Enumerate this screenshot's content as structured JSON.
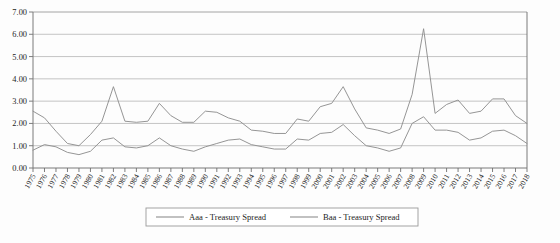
{
  "chart_data": {
    "type": "line",
    "title": "",
    "subtitle": "",
    "xlabel": "",
    "ylabel": "",
    "ylim": [
      0.0,
      7.0
    ],
    "ytick_step": 1.0,
    "ytick_labels": [
      "0.00",
      "1.00",
      "2.00",
      "3.00",
      "4.00",
      "5.00",
      "6.00",
      "7.00"
    ],
    "ytick_values": [
      0,
      1,
      2,
      3,
      4,
      5,
      6,
      7
    ],
    "grid": "horizontal",
    "legend_position": "bottom",
    "categories": [
      "1975",
      "1976",
      "1977",
      "1978",
      "1979",
      "1980",
      "1981",
      "1982",
      "1983",
      "1984",
      "1985",
      "1986",
      "1987",
      "1988",
      "1989",
      "1990",
      "1991",
      "1992",
      "1993",
      "1994",
      "1995",
      "1996",
      "1997",
      "1998",
      "1999",
      "2000",
      "2001",
      "2002",
      "2003",
      "2004",
      "2005",
      "2006",
      "2007",
      "2008",
      "2009",
      "2010",
      "2011",
      "2012",
      "2013",
      "2014",
      "2015",
      "2016",
      "2017",
      "2018"
    ],
    "series": [
      {
        "name": "Aaa - Treasury Spread",
        "color": "#8f8f8f",
        "values": [
          0.8,
          1.05,
          0.95,
          0.7,
          0.6,
          0.75,
          1.25,
          1.35,
          0.95,
          0.9,
          1.0,
          1.35,
          1.0,
          0.85,
          0.75,
          0.95,
          1.1,
          1.25,
          1.3,
          1.05,
          0.95,
          0.85,
          0.85,
          1.3,
          1.25,
          1.55,
          1.6,
          1.95,
          1.45,
          1.0,
          0.9,
          0.75,
          0.9,
          2.0,
          2.3,
          1.7,
          1.7,
          1.6,
          1.25,
          1.35,
          1.65,
          1.7,
          1.45,
          1.1
        ]
      },
      {
        "name": "Baa - Treasury Spread",
        "color": "#8f8f8f",
        "values": [
          2.55,
          2.25,
          1.65,
          1.1,
          1.0,
          1.5,
          2.1,
          3.65,
          2.1,
          2.05,
          2.1,
          2.9,
          2.35,
          2.05,
          2.05,
          2.55,
          2.5,
          2.25,
          2.1,
          1.7,
          1.65,
          1.55,
          1.55,
          2.2,
          2.1,
          2.75,
          2.9,
          3.65,
          2.65,
          1.8,
          1.7,
          1.55,
          1.75,
          3.3,
          6.25,
          2.45,
          2.85,
          3.05,
          2.45,
          2.55,
          3.1,
          3.1,
          2.35,
          2.0
        ]
      }
    ]
  },
  "legend": {
    "entries": [
      {
        "label": "Aaa - Treasury Spread"
      },
      {
        "label": "Baa - Treasury Spread"
      }
    ]
  }
}
